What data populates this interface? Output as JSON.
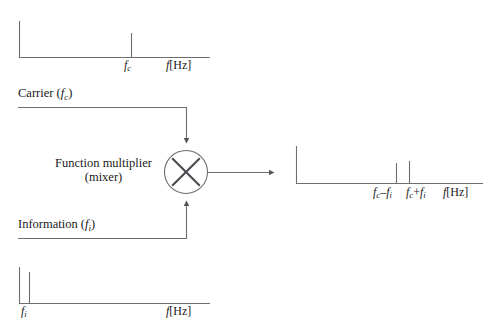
{
  "diagram": {
    "stroke_color": "#55565a",
    "text_color": "#1a1a1a",
    "background": "#ffffff"
  },
  "mixer": {
    "label_line1": "Function multiplier",
    "label_line2": "(mixer)",
    "symbol": "multiply-x",
    "cx": 186,
    "cy": 172,
    "r": 22
  },
  "inputs": {
    "carrier": {
      "label_prefix": "Carrier (",
      "var": "f",
      "sub": "c",
      "label_suffix": ")",
      "label_full": "Carrier (fc)"
    },
    "information": {
      "label_prefix": "Information (",
      "var": "f",
      "sub": "i",
      "label_suffix": ")",
      "label_full": "Information (fi)"
    }
  },
  "spectra": [
    {
      "id": "carrier-spectrum",
      "position": "top-left",
      "axis_label": "f[Hz]",
      "axis_label_var": "f",
      "axis_label_unit": "[Hz]",
      "x_axis": {
        "x0": 19,
        "x1": 210,
        "y": 57
      },
      "y_axis": {
        "x": 19,
        "y0": 21,
        "y1": 57
      },
      "lines": [
        {
          "name": "carrier-tone",
          "x": 131,
          "top": 33,
          "height": 24,
          "tick_label_var": "f",
          "tick_label_sub": "c"
        }
      ]
    },
    {
      "id": "information-spectrum",
      "position": "bottom-left",
      "axis_label": "f[Hz]",
      "axis_label_var": "f",
      "axis_label_unit": "[Hz]",
      "x_axis": {
        "x0": 19,
        "x1": 210,
        "y": 303
      },
      "y_axis": {
        "x": 19,
        "y0": 267,
        "y1": 303
      },
      "lines": [
        {
          "name": "information-tone",
          "x": 29,
          "top": 272,
          "height": 31,
          "tick_label_var": "f",
          "tick_label_sub": "i"
        }
      ]
    },
    {
      "id": "output-spectrum",
      "position": "right",
      "axis_label": "f[Hz]",
      "axis_label_var": "f",
      "axis_label_unit": "[Hz]",
      "x_axis": {
        "x0": 296,
        "x1": 483,
        "y": 183
      },
      "y_axis": {
        "x": 296,
        "y0": 146,
        "y1": 183
      },
      "lines": [
        {
          "name": "lower-sideband",
          "x": 396,
          "top": 163,
          "height": 20,
          "tick_label_var": "f",
          "tick_label_sub": "c",
          "tick_label_op": "–",
          "tick_label_var2": "f",
          "tick_label_sub2": "i"
        },
        {
          "name": "upper-sideband",
          "x": 409,
          "top": 161,
          "height": 22,
          "tick_label_var": "f",
          "tick_label_sub": "c",
          "tick_label_op": "+",
          "tick_label_var2": "f",
          "tick_label_sub2": "i"
        }
      ]
    }
  ],
  "connectors": [
    {
      "name": "carrier-input-line",
      "from": "carrier-label",
      "to": "mixer-top",
      "arrow": "down"
    },
    {
      "name": "information-input-line",
      "from": "information-label",
      "to": "mixer-bottom",
      "arrow": "up"
    },
    {
      "name": "mixer-output-line",
      "from": "mixer-right",
      "to": "output-spectrum",
      "arrow": "right"
    }
  ]
}
